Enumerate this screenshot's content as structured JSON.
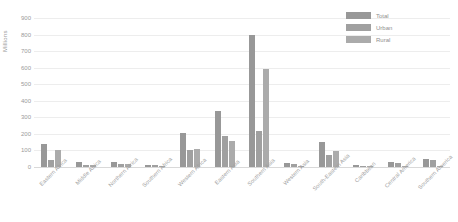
{
  "chart_data": {
    "type": "bar",
    "title": "",
    "xlabel": "",
    "ylabel": "Millions",
    "ylim": [
      0,
      900
    ],
    "yticks": [
      0,
      100,
      200,
      300,
      400,
      500,
      600,
      700,
      800,
      900
    ],
    "grid": true,
    "legend_position": "top-right",
    "categories": [
      "Eastern Africa",
      "Middle Africa",
      "Northern Africa",
      "Southern Africa",
      "Western Africa",
      "Eastern Asia",
      "Southern Asia",
      "Western Asia",
      "South-Eastern Asia",
      "Caribbean",
      "Central America",
      "Southern America"
    ],
    "series": [
      {
        "name": "Total",
        "color": "#989898",
        "values": [
          140,
          30,
          32,
          14,
          205,
          340,
          800,
          22,
          152,
          10,
          30,
          46
        ]
      },
      {
        "name": "Urban",
        "color": "#a0a0a0",
        "values": [
          42,
          14,
          20,
          10,
          105,
          190,
          215,
          20,
          74,
          7,
          25,
          42
        ]
      },
      {
        "name": "Rural",
        "color": "#ababab",
        "values": [
          104,
          10,
          16,
          6,
          110,
          155,
          595,
          5,
          96,
          4,
          6,
          6
        ]
      }
    ]
  },
  "axis": {
    "y_title": "Millions"
  }
}
